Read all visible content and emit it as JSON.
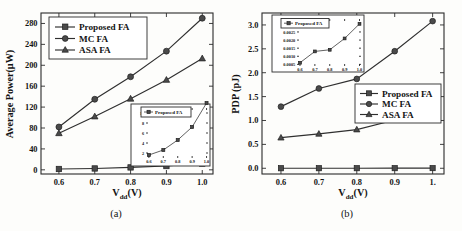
{
  "figure": {
    "panels": [
      {
        "caption": "(a)",
        "xlabel_main": "V",
        "xlabel_sub": "dd",
        "xlabel_tail": "(V)",
        "ylabel": "Average Power(μW)",
        "legend": [
          "Proposed FA",
          "MC FA",
          "ASA FA"
        ],
        "xticks": [
          "0.6",
          "0.7",
          "0.8",
          "0.9",
          "1.0"
        ],
        "yticks": [
          "0",
          "40",
          "80",
          "120",
          "160",
          "200",
          "240",
          "280"
        ],
        "inset": {
          "legend": "Proposed FA",
          "xticks": [
            "0.6",
            "0.7",
            "0.8",
            "0.9",
            "1.0"
          ],
          "yticks": [
            "2",
            "4",
            "6",
            "8",
            "10"
          ]
        }
      },
      {
        "caption": "(b)",
        "xlabel_main": "V",
        "xlabel_sub": "dd",
        "xlabel_tail": "(V)",
        "ylabel": "PDP (pJ)",
        "legend": [
          "Proposed FA",
          "MC FA",
          "ASA FA"
        ],
        "xticks": [
          "0.6",
          "0.7",
          "0.8",
          "0.9",
          "1."
        ],
        "yticks": [
          "0.0",
          "0.5",
          "1.0",
          "1.5",
          "2.0",
          "2.5",
          "3.0"
        ],
        "inset": {
          "legend": "Proposed FA",
          "xticks": [
            "0.6",
            "0.7",
            "0.8",
            "0.9",
            "1.0"
          ],
          "yticks": [
            "0.0005",
            "0.0010",
            "0.0015",
            "0.0020",
            "0.0025",
            "0.0030"
          ]
        }
      }
    ]
  },
  "chart_data": [
    {
      "type": "line",
      "title": "",
      "xlabel": "Vdd(V)",
      "ylabel": "Average Power(μW)",
      "x": [
        0.6,
        0.7,
        0.8,
        0.9,
        1.0
      ],
      "xlim": [
        0.55,
        1.03
      ],
      "ylim": [
        -8,
        300
      ],
      "grid": false,
      "legend_position": "top-left",
      "series": [
        {
          "name": "Proposed FA",
          "marker": "square",
          "values": [
            1.6,
            2.6,
            4.6,
            7.2,
            12.0
          ]
        },
        {
          "name": "MC FA",
          "marker": "circle",
          "values": [
            82,
            135,
            178,
            227,
            290
          ]
        },
        {
          "name": "ASA FA",
          "marker": "triangle",
          "values": [
            70,
            102,
            136,
            172,
            213
          ]
        }
      ],
      "inset": {
        "type": "line",
        "xlabel": "",
        "ylabel": "",
        "x": [
          0.6,
          0.7,
          0.8,
          0.9,
          1.0
        ],
        "xlim": [
          0.58,
          1.01
        ],
        "ylim": [
          1.0,
          11.0
        ],
        "series": [
          {
            "name": "Proposed FA",
            "marker": "square",
            "values": [
              1.6,
              2.6,
              4.6,
              7.2,
              12.0
            ]
          }
        ]
      }
    },
    {
      "type": "line",
      "title": "",
      "xlabel": "Vdd(V)",
      "ylabel": "PDP (pJ)",
      "x": [
        0.6,
        0.7,
        0.8,
        0.9,
        1.0
      ],
      "xlim": [
        0.55,
        1.03
      ],
      "ylim": [
        -0.12,
        3.25
      ],
      "grid": false,
      "legend_position": "middle-right",
      "series": [
        {
          "name": "Proposed FA",
          "marker": "square",
          "values": [
            0.0006,
            0.0013,
            0.0014,
            0.0021,
            0.003
          ]
        },
        {
          "name": "MC FA",
          "marker": "circle",
          "values": [
            1.29,
            1.67,
            1.87,
            2.45,
            3.08
          ]
        },
        {
          "name": "ASA FA",
          "marker": "triangle",
          "values": [
            0.64,
            0.72,
            0.81,
            1.01,
            1.19
          ]
        }
      ],
      "inset": {
        "type": "line",
        "xlabel": "",
        "ylabel": "",
        "x": [
          0.6,
          0.7,
          0.8,
          0.9,
          1.0
        ],
        "xlim": [
          0.58,
          1.01
        ],
        "ylim": [
          0.0004,
          0.0033
        ],
        "series": [
          {
            "name": "Proposed FA",
            "marker": "square",
            "values": [
              0.0006,
              0.0013,
              0.0014,
              0.0021,
              0.003
            ]
          }
        ]
      }
    }
  ]
}
